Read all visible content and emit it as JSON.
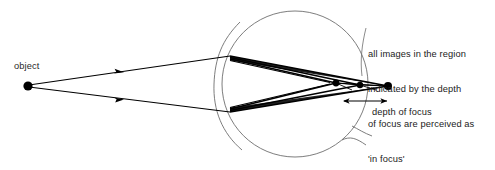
{
  "diagram": {
    "type": "optics-ray-diagram",
    "background_color": "#ffffff",
    "stroke_color": "#000000",
    "eye_outline_color": "#6e6e6e",
    "text_color": "#1b1b1b"
  },
  "labels": {
    "object": "object",
    "depth_of_focus": "depth of focus",
    "annotation_line_1": "all images in the region",
    "annotation_line_2": "indicated by the depth",
    "annotation_line_3": "of focus are perceived as",
    "annotation_line_4": "'in focus'"
  },
  "geometry": {
    "object_point": {
      "x": 28,
      "y": 86
    },
    "eye_circle": {
      "cx": 295,
      "cy": 84,
      "r": 73
    },
    "cornea_arc": {
      "x": 222,
      "y_top": 40,
      "y_bottom": 132
    },
    "focus_points": [
      {
        "x": 336,
        "y": 83,
        "label": "near-focus-point"
      },
      {
        "x": 360,
        "y": 85,
        "label": "mid-focus-point"
      },
      {
        "x": 388,
        "y": 86,
        "label": "retinal-focus-point"
      }
    ],
    "depth_of_focus_span": {
      "x_start": 342,
      "x_end": 389,
      "y": 101
    },
    "ray_arrowheads_x": 120
  }
}
